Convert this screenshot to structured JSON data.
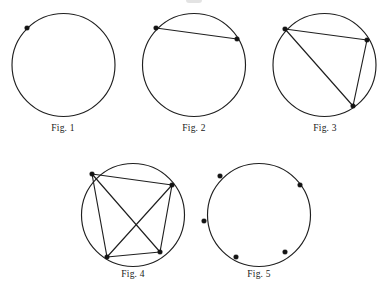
{
  "page": {
    "background_color": "#ffffff",
    "stroke_color": "#1f1f1f",
    "point_color": "#141414",
    "width": 383,
    "height": 288
  },
  "chart_data": {
    "type": "diagram",
    "figures": [
      {
        "id": "fig1",
        "caption": "Fig. 1",
        "caption_x": 63,
        "caption_y": 131,
        "circle": {
          "cx": 63.5,
          "cy": 65.0,
          "r": 51.5
        },
        "point_count": 1,
        "chord_count": 0,
        "points": [
          {
            "label": "A",
            "x": 27.0,
            "y": 28.0
          }
        ],
        "chords": []
      },
      {
        "id": "fig2",
        "caption": "Fig. 2",
        "caption_x": 194,
        "caption_y": 131,
        "circle": {
          "cx": 194.0,
          "cy": 65.0,
          "r": 51.5
        },
        "point_count": 2,
        "chord_count": 1,
        "points": [
          {
            "label": "A",
            "x": 156.0,
            "y": 28.0
          },
          {
            "label": "B",
            "x": 237.0,
            "y": 39.0
          }
        ],
        "chords": [
          {
            "from": 0,
            "to": 1
          }
        ]
      },
      {
        "id": "fig3",
        "caption": "Fig. 3",
        "caption_x": 325,
        "caption_y": 131,
        "circle": {
          "cx": 324.5,
          "cy": 65.0,
          "r": 51.5
        },
        "point_count": 3,
        "chord_count": 3,
        "points": [
          {
            "label": "A",
            "x": 285.0,
            "y": 29.0
          },
          {
            "label": "B",
            "x": 367.0,
            "y": 40.0
          },
          {
            "label": "C",
            "x": 353.0,
            "y": 106.0
          }
        ],
        "chords": [
          {
            "from": 0,
            "to": 1
          },
          {
            "from": 1,
            "to": 2
          },
          {
            "from": 0,
            "to": 2
          }
        ]
      },
      {
        "id": "fig4",
        "caption": "Fig. 4",
        "caption_x": 133,
        "caption_y": 277,
        "circle": {
          "cx": 133.0,
          "cy": 215.0,
          "r": 51.5
        },
        "point_count": 4,
        "chord_count": 6,
        "points": [
          {
            "label": "A",
            "x": 92.0,
            "y": 174.0
          },
          {
            "label": "B",
            "x": 172.0,
            "y": 185.0
          },
          {
            "label": "C",
            "x": 160.0,
            "y": 252.0
          },
          {
            "label": "D",
            "x": 107.0,
            "y": 257.0
          }
        ],
        "chords": [
          {
            "from": 0,
            "to": 1
          },
          {
            "from": 1,
            "to": 2
          },
          {
            "from": 2,
            "to": 3
          },
          {
            "from": 3,
            "to": 0
          },
          {
            "from": 0,
            "to": 2
          },
          {
            "from": 1,
            "to": 3
          }
        ]
      },
      {
        "id": "fig5",
        "caption": "Fig. 5",
        "caption_x": 259,
        "caption_y": 277,
        "circle": {
          "cx": 259.0,
          "cy": 215.0,
          "r": 51.5
        },
        "point_count": 5,
        "chord_count": 0,
        "points": [
          {
            "label": "A",
            "x": 220.0,
            "y": 176.0
          },
          {
            "label": "B",
            "x": 300.0,
            "y": 185.0
          },
          {
            "label": "C",
            "x": 285.0,
            "y": 252.0
          },
          {
            "label": "D",
            "x": 236.0,
            "y": 257.0
          },
          {
            "label": "E",
            "x": 204.0,
            "y": 221.0
          }
        ],
        "chords": []
      }
    ]
  }
}
